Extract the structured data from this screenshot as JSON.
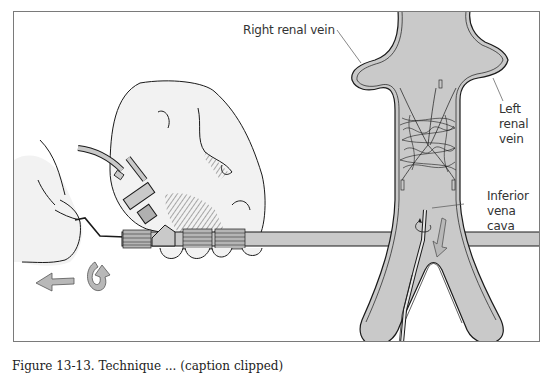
{
  "figure": {
    "labels": {
      "right_renal_vein": "Right renal vein",
      "left_renal_vein": [
        "Left",
        "renal",
        "vein"
      ],
      "inferior_vena_cava": [
        "Inferior",
        "vena",
        "cava"
      ]
    },
    "caption_partial": "Figure 13-13. Technique ... (caption clipped)",
    "colors": {
      "vessel_fill": "#c9c9c9",
      "skin": "#f1f1f1",
      "line": "#1a1a1a",
      "frame": "#7a7a7a",
      "arrow_fill": "#b8b8b8"
    },
    "panels": [
      {
        "name": "hands-manipulating-catheter",
        "description": "Two hands holding catheter hub with connectors; arrows indicate rotation and withdrawal"
      },
      {
        "name": "vena-cava-filter-retrieval",
        "description": "Inferior vena cava with coiled filter below renal veins; catheter and rotation/withdrawal arrows"
      }
    ]
  }
}
